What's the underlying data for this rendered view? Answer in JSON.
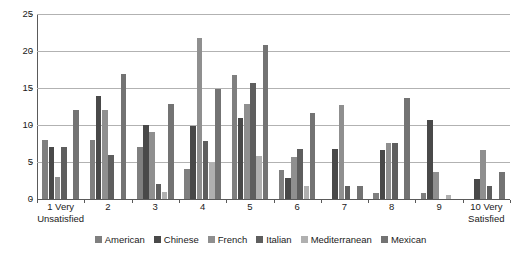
{
  "chart_data": {
    "type": "bar",
    "title": "",
    "subtitle": "",
    "xlabel": "",
    "ylabel": "",
    "ylim": [
      0,
      25
    ],
    "yticks": [
      0,
      5,
      10,
      15,
      20,
      25
    ],
    "grid": "horizontal",
    "legend_position": "bottom",
    "categories": [
      "1 Very Unsatisfied",
      "2",
      "3",
      "4",
      "5",
      "6",
      "7",
      "8",
      "9",
      "10 Very Satisfied"
    ],
    "category_lines": [
      [
        "1 Very",
        "Unsatisfied"
      ],
      [
        "2",
        ""
      ],
      [
        "3",
        ""
      ],
      [
        "4",
        ""
      ],
      [
        "5",
        ""
      ],
      [
        "6",
        ""
      ],
      [
        "7",
        ""
      ],
      [
        "8",
        ""
      ],
      [
        "9",
        ""
      ],
      [
        "10 Very",
        "Satisfied"
      ]
    ],
    "series": [
      {
        "name": "American",
        "color": "#7f7f7f",
        "values": [
          8.0,
          8.0,
          7.0,
          4.0,
          16.8,
          3.9,
          0.0,
          0.8,
          0.8,
          0.0
        ]
      },
      {
        "name": "Chinese",
        "color": "#494949",
        "values": [
          7.0,
          13.9,
          10.0,
          9.9,
          10.9,
          2.9,
          6.7,
          6.6,
          10.7,
          2.7
        ]
      },
      {
        "name": "French",
        "color": "#8f8f8f",
        "values": [
          3.0,
          12.0,
          9.0,
          21.8,
          12.8,
          5.7,
          12.7,
          7.6,
          3.7,
          6.6
        ]
      },
      {
        "name": "Italian",
        "color": "#5e5e5e",
        "values": [
          7.0,
          6.0,
          2.0,
          7.8,
          15.7,
          6.7,
          1.8,
          7.6,
          0.0,
          1.7
        ]
      },
      {
        "name": "Mediterranean",
        "color": "#b0b0b0",
        "values": [
          0.0,
          0.0,
          0.9,
          4.8,
          5.8,
          1.8,
          0.0,
          0.0,
          0.6,
          0.0
        ]
      },
      {
        "name": "Mexican",
        "color": "#737373",
        "values": [
          12.0,
          16.9,
          12.8,
          14.8,
          20.8,
          11.6,
          1.8,
          13.6,
          0.0,
          3.6
        ]
      }
    ]
  },
  "axis": {
    "y_tick_labels": [
      "0",
      "5",
      "10",
      "15",
      "20",
      "25"
    ]
  }
}
